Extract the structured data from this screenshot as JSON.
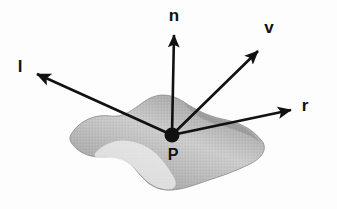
{
  "diagram": {
    "background_color": "#fdfdfd",
    "ink_color": "#111111",
    "surface": {
      "name": "surface-patch",
      "fill_light": "#f2f2f2",
      "fill_mid": "#b8b8b8",
      "fill_dark": "#8f8f8f",
      "edge_color": "#7d7d7d",
      "description": "shaded wavy surface patch"
    },
    "point": {
      "label": "P",
      "name": "surface-point-p",
      "x": 172,
      "y": 135,
      "radius": 7.5
    },
    "vectors": [
      {
        "id": "n",
        "label": "n",
        "name": "normal-vector",
        "meaning": "surface normal",
        "from": {
          "x": 172,
          "y": 135
        },
        "to": {
          "x": 174,
          "y": 29
        },
        "label_pos": {
          "x": 174,
          "y": 20
        }
      },
      {
        "id": "v",
        "label": "v",
        "name": "view-vector",
        "meaning": "view direction",
        "from": {
          "x": 172,
          "y": 135
        },
        "to": {
          "x": 262,
          "y": 47
        },
        "label_pos": {
          "x": 269,
          "y": 32
        }
      },
      {
        "id": "l",
        "label": "l",
        "name": "light-vector",
        "meaning": "light direction",
        "from": {
          "x": 172,
          "y": 135
        },
        "to": {
          "x": 32,
          "y": 72
        },
        "label_pos": {
          "x": 19,
          "y": 71
        }
      },
      {
        "id": "r",
        "label": "r",
        "name": "reflection-vector",
        "meaning": "reflection direction",
        "from": {
          "x": 172,
          "y": 135
        },
        "to": {
          "x": 296,
          "y": 109
        },
        "label_pos": {
          "x": 304,
          "y": 110
        }
      }
    ]
  }
}
